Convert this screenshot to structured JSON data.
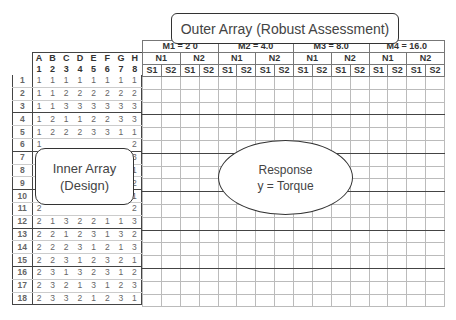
{
  "outer_array": {
    "label": "Outer Array (Robust Assessment)",
    "m_levels": [
      "M1 = 2 0",
      "M2 = 4.0",
      "M3 = 8.0",
      "M4 = 16.0"
    ],
    "n_levels": [
      "N1",
      "N2"
    ],
    "s_levels": [
      "S1",
      "S2"
    ]
  },
  "inner_array": {
    "label_line1": "Inner Array",
    "label_line2": "(Design)",
    "factor_letters": [
      "A",
      "B",
      "C",
      "D",
      "E",
      "F",
      "G",
      "H"
    ],
    "factor_numbers": [
      "1",
      "2",
      "3",
      "4",
      "5",
      "6",
      "7",
      "8"
    ],
    "rows": [
      {
        "n": "1",
        "v": [
          "1",
          "1",
          "1",
          "1",
          "1",
          "1",
          "1",
          "1"
        ]
      },
      {
        "n": "2",
        "v": [
          "1",
          "1",
          "2",
          "2",
          "2",
          "2",
          "2",
          "2"
        ]
      },
      {
        "n": "3",
        "v": [
          "1",
          "1",
          "3",
          "3",
          "3",
          "3",
          "3",
          "3"
        ]
      },
      {
        "n": "4",
        "v": [
          "1",
          "2",
          "1",
          "1",
          "2",
          "2",
          "3",
          "3"
        ]
      },
      {
        "n": "5",
        "v": [
          "1",
          "2",
          "2",
          "2",
          "3",
          "3",
          "1",
          "1"
        ]
      },
      {
        "n": "6",
        "v": [
          "1",
          "",
          "",
          "",
          "",
          "",
          "",
          "2"
        ]
      },
      {
        "n": "7",
        "v": [
          "",
          "",
          "",
          "",
          "",
          "",
          "",
          "3"
        ]
      },
      {
        "n": "8",
        "v": [
          "",
          "",
          "",
          "",
          "",
          "",
          "",
          "1"
        ]
      },
      {
        "n": "9",
        "v": [
          "",
          "",
          "",
          "",
          "",
          "",
          "",
          "2"
        ]
      },
      {
        "n": "10",
        "v": [
          "",
          "",
          "",
          "",
          "",
          "",
          "",
          "1"
        ]
      },
      {
        "n": "11",
        "v": [
          "2",
          "",
          "",
          "",
          "",
          "",
          "",
          "2"
        ]
      },
      {
        "n": "12",
        "v": [
          "2",
          "1",
          "3",
          "2",
          "2",
          "1",
          "1",
          "3"
        ]
      },
      {
        "n": "13",
        "v": [
          "2",
          "2",
          "1",
          "2",
          "3",
          "1",
          "3",
          "2"
        ]
      },
      {
        "n": "14",
        "v": [
          "2",
          "2",
          "2",
          "3",
          "1",
          "2",
          "1",
          "3"
        ]
      },
      {
        "n": "15",
        "v": [
          "2",
          "2",
          "3",
          "1",
          "2",
          "3",
          "2",
          "1"
        ]
      },
      {
        "n": "16",
        "v": [
          "2",
          "3",
          "1",
          "3",
          "2",
          "3",
          "1",
          "2"
        ]
      },
      {
        "n": "17",
        "v": [
          "2",
          "3",
          "2",
          "1",
          "3",
          "1",
          "2",
          "3"
        ]
      },
      {
        "n": "18",
        "v": [
          "2",
          "3",
          "3",
          "2",
          "1",
          "2",
          "3",
          "1"
        ]
      }
    ]
  },
  "response": {
    "line1": "Response",
    "line2": "y = Torque"
  }
}
